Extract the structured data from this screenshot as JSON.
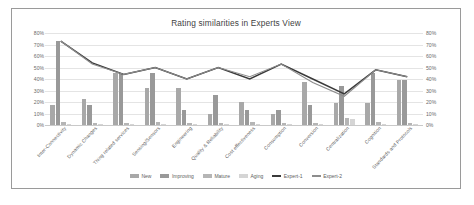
{
  "chart_data": {
    "type": "bar",
    "title": "Rating similarities in Experts View",
    "xlabel": "",
    "ylabel": "",
    "ylim": [
      0,
      80
    ],
    "ytick_labels": [
      "80%",
      "70%",
      "60%",
      "50%",
      "40%",
      "30%",
      "20%",
      "10%",
      "0%"
    ],
    "ytick_values": [
      80,
      70,
      60,
      50,
      40,
      30,
      20,
      10,
      0
    ],
    "y_axis_left": [
      "80%",
      "70%",
      "60%",
      "50%",
      "40%",
      "30%",
      "20%",
      "10%",
      "0%"
    ],
    "y_axis_right": [
      "80%",
      "70%",
      "60%",
      "50%",
      "40%",
      "30%",
      "20%",
      "10%",
      "0%"
    ],
    "grid": true,
    "legend_position": "bottom",
    "categories": [
      "Inter-Connectivity",
      "Dynamic Changes",
      "Thing related services",
      "Sensing/Sensors",
      "Engineering",
      "Quality & Reliability",
      "Cost effectiveness",
      "Consumption",
      "Conversion",
      "Centralization",
      "Cognition",
      "Standards and Protocols"
    ],
    "series": [
      {
        "name": "New",
        "type": "bar",
        "color": "#a8a8a8",
        "values": [
          17,
          23,
          45,
          32,
          32,
          10,
          20,
          10,
          37,
          19,
          19,
          39
        ]
      },
      {
        "name": "Improving",
        "type": "bar",
        "color": "#999999",
        "values": [
          73,
          17,
          45,
          45,
          13,
          26,
          13,
          13,
          17,
          34,
          45,
          39
        ]
      },
      {
        "name": "Mature",
        "type": "bar",
        "color": "#b5b5b5",
        "values": [
          3,
          2,
          2,
          3,
          2,
          2,
          3,
          2,
          2,
          6,
          3,
          2
        ]
      },
      {
        "name": "Aging",
        "type": "bar",
        "color": "#d5d5d5",
        "values": [
          0,
          0,
          1,
          1,
          0,
          0,
          1,
          0,
          0,
          5,
          1,
          0
        ]
      },
      {
        "name": "Expert-1",
        "type": "line",
        "color": "#3a3a3a",
        "values": [
          73,
          54,
          44,
          50,
          40,
          50,
          40,
          53,
          40,
          27,
          48,
          42
        ]
      },
      {
        "name": "Expert-2",
        "type": "line",
        "color": "#8d8d8d",
        "values": [
          73,
          53,
          44,
          50,
          40,
          50,
          42,
          53,
          37,
          25,
          48,
          42
        ]
      }
    ],
    "legend": [
      {
        "label": "New",
        "marker": "bar",
        "color": "#a8a8a8"
      },
      {
        "label": "Improving",
        "marker": "bar",
        "color": "#999999"
      },
      {
        "label": "Mature",
        "marker": "bar",
        "color": "#b5b5b5"
      },
      {
        "label": "Aging",
        "marker": "bar",
        "color": "#d5d5d5"
      },
      {
        "label": "Expert-1",
        "marker": "line",
        "color": "#3a3a3a"
      },
      {
        "label": "Expert-2",
        "marker": "line",
        "color": "#8d8d8d"
      }
    ]
  }
}
